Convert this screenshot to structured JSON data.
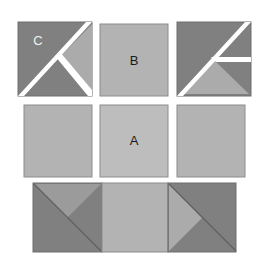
{
  "figure": {
    "background_color": "#ffffff",
    "colors": {
      "dark_gray": "#808080",
      "medium_gray": "#8f8f8f",
      "light_gray": "#b3b3b3",
      "lighter_gray": "#bdbdbd",
      "white_gap": "#ffffff",
      "outline": "#6e6e6e",
      "label_dark": "#1a1a1a",
      "label_light": "#f2f2f2"
    },
    "labels": {
      "a": "A",
      "b": "B",
      "c": "C"
    },
    "rows": [
      {
        "name": "top-row",
        "tiles": [
          {
            "name": "tile-top-left",
            "label": "C",
            "pattern": "x-split-white-diagonals-light-right-triangle"
          },
          {
            "name": "tile-top-center",
            "label": "B",
            "pattern": "plain-light-square"
          },
          {
            "name": "tile-top-right",
            "label": "",
            "pattern": "x-split-white-diagonals-light-bottom-triangle"
          }
        ]
      },
      {
        "name": "middle-row",
        "tiles": [
          {
            "name": "tile-middle-left",
            "label": "",
            "pattern": "plain-light-square"
          },
          {
            "name": "tile-middle-center",
            "label": "A",
            "pattern": "plain-light-square"
          },
          {
            "name": "tile-middle-right",
            "label": "",
            "pattern": "plain-light-square"
          }
        ]
      },
      {
        "name": "bottom-row",
        "tiles": [
          {
            "name": "tile-bottom-left",
            "label": "",
            "pattern": "dark-with-down-triangle-and-diagonal"
          },
          {
            "name": "tile-bottom-center",
            "label": "",
            "pattern": "plain-light-square"
          },
          {
            "name": "tile-bottom-right",
            "label": "",
            "pattern": "dark-with-left-triangle-and-diagonal"
          }
        ]
      }
    ]
  }
}
